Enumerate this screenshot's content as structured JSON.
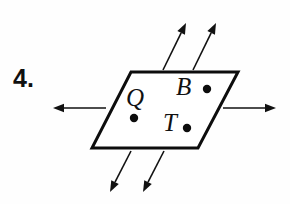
{
  "figure": {
    "problem_number": "4.",
    "shape": {
      "name": "plane",
      "type": "parallelogram",
      "corners": [
        [
          131,
          72
        ],
        [
          238,
          72
        ],
        [
          198,
          148
        ],
        [
          92,
          148
        ]
      ],
      "stroke_color": "#0d0d0d",
      "stroke_width": 3,
      "fill_color": "#ffffff"
    },
    "points": [
      {
        "label": "Q",
        "label_x": 126,
        "label_y": 85,
        "dot_x": 134,
        "dot_y": 118,
        "dot_r": 4.2
      },
      {
        "label": "B",
        "label_x": 176,
        "label_y": 74,
        "dot_x": 207,
        "dot_y": 89,
        "dot_r": 4.2
      },
      {
        "label": "T",
        "label_x": 163,
        "label_y": 110,
        "dot_x": 187,
        "dot_y": 128,
        "dot_r": 4.2
      }
    ],
    "arrows": [
      {
        "name": "arrow-up-left",
        "direction": "up-right",
        "x1": 163,
        "y1": 70,
        "x2": 186,
        "y2": 23
      },
      {
        "name": "arrow-up-right",
        "direction": "up-right",
        "x1": 193,
        "y1": 70,
        "x2": 216,
        "y2": 23
      },
      {
        "name": "arrow-left",
        "direction": "left",
        "x1": 106,
        "y1": 108,
        "x2": 53,
        "y2": 108
      },
      {
        "name": "arrow-right",
        "direction": "right",
        "x1": 223,
        "y1": 108,
        "x2": 276,
        "y2": 108
      },
      {
        "name": "arrow-down-left",
        "direction": "down-left",
        "x1": 131,
        "y1": 151,
        "x2": 110,
        "y2": 192
      },
      {
        "name": "arrow-down-right",
        "direction": "down-left",
        "x1": 164,
        "y1": 151,
        "x2": 143,
        "y2": 192
      }
    ],
    "arrow_color": "#111111",
    "arrow_stroke_width": 1.6,
    "background_color": "#fefefe"
  }
}
